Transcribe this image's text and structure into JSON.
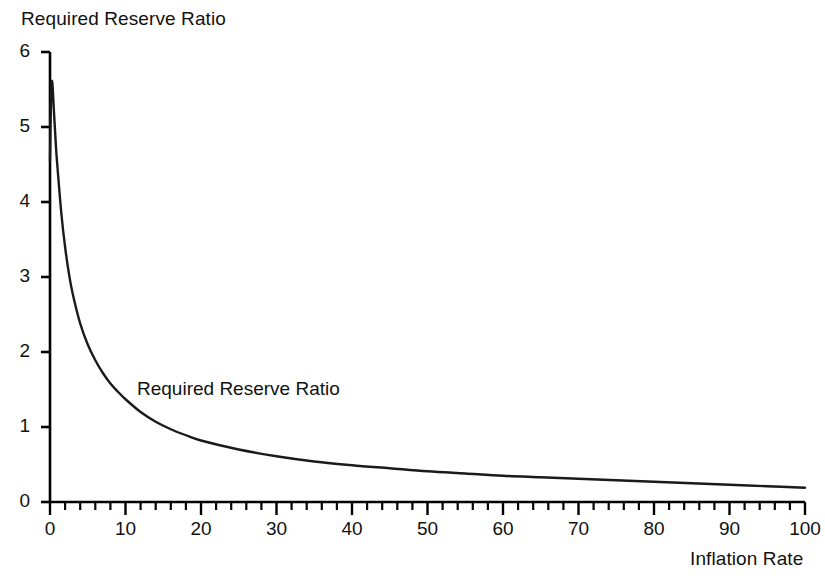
{
  "chart_data": {
    "type": "line",
    "title": "",
    "ylabel": "Required Reserve Ratio",
    "xlabel": "Inflation Rate",
    "xlim": [
      0,
      100
    ],
    "ylim": [
      0,
      6
    ],
    "xticks": [
      0,
      10,
      20,
      30,
      40,
      50,
      60,
      70,
      80,
      90,
      100
    ],
    "xtick_labels": [
      "0",
      "10",
      "20",
      "30",
      "40",
      "50",
      "60",
      "70",
      "80",
      "90",
      "100"
    ],
    "x_minor_tick_step": 2,
    "yticks": [
      0,
      1,
      2,
      3,
      4,
      5,
      6
    ],
    "ytick_labels": [
      "0",
      "1",
      "2",
      "3",
      "4",
      "5",
      "6"
    ],
    "grid": false,
    "legend_position": "inline-annotation",
    "series": [
      {
        "name": "Required Reserve Ratio",
        "annotation": "Required Reserve Ratio",
        "color": "#1a1a1a",
        "line_width": 2.4,
        "x": [
          0.0,
          0.15,
          0.3,
          0.5,
          0.8,
          1.0,
          1.5,
          2.0,
          2.5,
          3.0,
          4.0,
          5.0,
          6.0,
          7.0,
          8.0,
          9.0,
          10.0,
          12.0,
          14.0,
          16.0,
          18.0,
          20.0,
          25.0,
          30.0,
          35.0,
          40.0,
          45.0,
          50.0,
          55.0,
          60.0,
          65.0,
          70.0,
          75.0,
          80.0,
          85.0,
          90.0,
          95.0,
          100.0
        ],
        "y": [
          4.55,
          5.45,
          5.6,
          5.25,
          4.72,
          4.45,
          3.85,
          3.4,
          3.05,
          2.78,
          2.38,
          2.1,
          1.89,
          1.72,
          1.58,
          1.47,
          1.37,
          1.2,
          1.07,
          0.97,
          0.89,
          0.82,
          0.7,
          0.61,
          0.54,
          0.49,
          0.45,
          0.41,
          0.38,
          0.35,
          0.33,
          0.31,
          0.29,
          0.27,
          0.25,
          0.23,
          0.21,
          0.19
        ]
      }
    ]
  },
  "axis": {
    "y_title": "Required Reserve Ratio",
    "x_title": "Inflation Rate"
  },
  "annotations": {
    "curve_label": "Required Reserve Ratio"
  },
  "style": {
    "axis_color": "#000000",
    "curve_color": "#1a1a1a",
    "background": "#ffffff"
  }
}
